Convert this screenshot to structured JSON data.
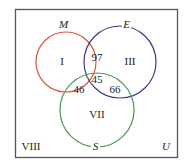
{
  "diagram": {
    "type": "venn",
    "universe_label": "U",
    "sets": [
      {
        "name": "M",
        "color": "#d9583f"
      },
      {
        "name": "E",
        "color": "#3d3f86"
      },
      {
        "name": "S",
        "color": "#4a9a55"
      }
    ],
    "regions": {
      "only_M": "I",
      "M_and_E_only": "97",
      "only_E": "III",
      "all_three": "45",
      "M_and_S_only": "46",
      "E_and_S_only": "66",
      "only_S": "VII",
      "outside": "VIII"
    }
  }
}
